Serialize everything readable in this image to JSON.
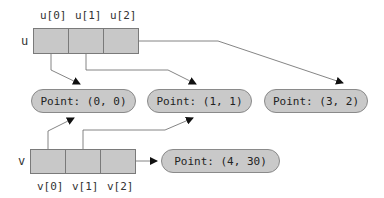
{
  "arrays": {
    "u": {
      "name": "u",
      "cells": [
        {
          "label": "u[0]",
          "points_to": "Point: (0, 0)"
        },
        {
          "label": "u[1]",
          "points_to": "Point: (1, 1)"
        },
        {
          "label": "u[2]",
          "points_to": "Point: (3, 2)"
        }
      ]
    },
    "v": {
      "name": "v",
      "cells": [
        {
          "label": "v[0]",
          "points_to": "Point: (0, 0)"
        },
        {
          "label": "v[1]",
          "points_to": "Point: (1, 1)"
        },
        {
          "label": "v[2]",
          "points_to": "Point: (4, 30)"
        }
      ]
    }
  },
  "objects": [
    {
      "label": "Point: (0, 0)"
    },
    {
      "label": "Point: (1, 1)"
    },
    {
      "label": "Point: (3, 2)"
    },
    {
      "label": "Point: (4, 30)"
    }
  ],
  "colors": {
    "cell_fill": "#c8c8c8",
    "object_fill": "#c9c9c9",
    "arrow": "#555555"
  }
}
